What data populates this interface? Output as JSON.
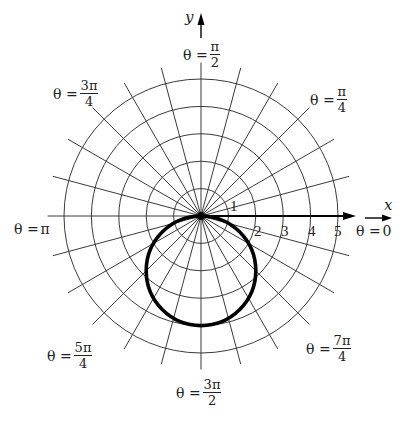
{
  "diagram": {
    "center": {
      "x": 201,
      "y": 216
    },
    "unit_px": 27.4,
    "rings": [
      1,
      2,
      3,
      4,
      5
    ],
    "spoke_step_deg": 15,
    "spoke_length_units": 5.6,
    "curve": {
      "equation": "r = -4 sin θ",
      "diameter_units": 4,
      "direction": "down"
    },
    "axes": {
      "x_label": "x",
      "y_label": "y"
    },
    "ticks": [
      "1",
      "2",
      "3",
      "4",
      "5"
    ],
    "angle_labels": {
      "zero": {
        "prefix": "θ = ",
        "value": "0"
      },
      "pi_over_4": {
        "prefix": "θ =",
        "num": "π",
        "den": "4"
      },
      "pi_over_2": {
        "prefix": "θ =",
        "num": "π",
        "den": "2"
      },
      "three_pi_over_4": {
        "prefix": "θ =",
        "num": "3π",
        "den": "4"
      },
      "pi": {
        "prefix": "θ = ",
        "value": "π"
      },
      "five_pi_over_4": {
        "prefix": "θ =",
        "num": "5π",
        "den": "4"
      },
      "three_pi_over_2": {
        "prefix": "θ =",
        "num": "3π",
        "den": "2"
      },
      "seven_pi_over_4": {
        "prefix": "θ =",
        "num": "7π",
        "den": "4"
      }
    },
    "colors": {
      "grid": "#3a3a3a",
      "curve": "#000000",
      "background": "#ffffff"
    }
  }
}
